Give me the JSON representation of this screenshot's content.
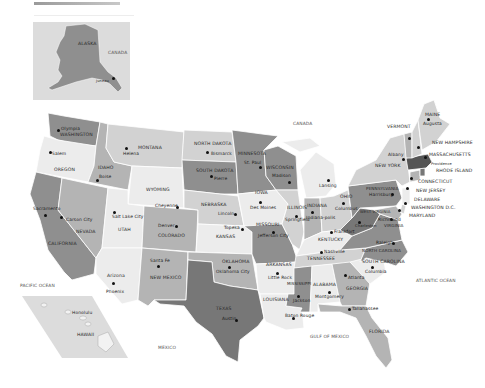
{
  "map": {
    "title_bar": "",
    "colors": {
      "background": "#ffffff",
      "water": "#ffffff",
      "light": "#ececec",
      "mid_light": "#d2d2d2",
      "mid": "#b4b4b4",
      "dark": "#8f8f8f",
      "darker": "#777777",
      "inset_bg": "#dcdcdc",
      "border": "#ffffff"
    },
    "insets": {
      "alaska": {
        "label": "ALASKA",
        "capital": "Juneau",
        "neighbor": "CANADA"
      },
      "hawaii": {
        "label": "HAWAII",
        "capital": "Honolulu"
      }
    },
    "geo_labels": {
      "canada": "CANADA",
      "mexico": "MEXICO",
      "pacific": "PACIFIC OCEAN",
      "atlantic": "ATLANTIC OCEAN",
      "gulf": "GULF OF MEXICO"
    },
    "states": [
      {
        "name": "WASHINGTON",
        "capital": "Olympia"
      },
      {
        "name": "OREGON",
        "capital": "Salem"
      },
      {
        "name": "CALIFORNIA",
        "capital": "Sacramento"
      },
      {
        "name": "NEVADA",
        "capital": "Carson City"
      },
      {
        "name": "IDAHO",
        "capital": "Boise"
      },
      {
        "name": "MONTANA",
        "capital": "Helena"
      },
      {
        "name": "WYOMING",
        "capital": "Cheyenne"
      },
      {
        "name": "UTAH",
        "capital": "Salt Lake City"
      },
      {
        "name": "ARIZONA",
        "capital": "Phoenix"
      },
      {
        "name": "COLORADO",
        "capital": "Denver"
      },
      {
        "name": "NEW MEXICO",
        "capital": "Santa Fe"
      },
      {
        "name": "NORTH DAKOTA",
        "capital": "Bismarck"
      },
      {
        "name": "SOUTH DAKOTA",
        "capital": "Pierre"
      },
      {
        "name": "NEBRASKA",
        "capital": "Lincoln"
      },
      {
        "name": "KANSAS",
        "capital": "Topeka"
      },
      {
        "name": "OKLAHOMA",
        "capital": "Oklahoma City"
      },
      {
        "name": "TEXAS",
        "capital": "Austin"
      },
      {
        "name": "MINNESOTA",
        "capital": "St. Paul"
      },
      {
        "name": "IOWA",
        "capital": "Des Moines"
      },
      {
        "name": "MISSOURI",
        "capital": "Jefferson City"
      },
      {
        "name": "ARKANSAS",
        "capital": "Little Rock"
      },
      {
        "name": "LOUISIANA",
        "capital": "Baton Rouge"
      },
      {
        "name": "WISCONSIN",
        "capital": "Madison"
      },
      {
        "name": "ILLINOIS",
        "capital": "Springfield"
      },
      {
        "name": "MICHIGAN",
        "capital": "Lansing"
      },
      {
        "name": "INDIANA",
        "capital": "Indianapolis"
      },
      {
        "name": "OHIO",
        "capital": "Columbus"
      },
      {
        "name": "KENTUCKY",
        "capital": "Frankfort"
      },
      {
        "name": "TENNESSEE",
        "capital": "Nashville"
      },
      {
        "name": "MISSISSIPPI",
        "capital": "Jackson"
      },
      {
        "name": "ALABAMA",
        "capital": "Montgomery"
      },
      {
        "name": "GEORGIA",
        "capital": "Atlanta"
      },
      {
        "name": "FLORIDA",
        "capital": "Tallahassee"
      },
      {
        "name": "SOUTH CAROLINA",
        "capital": "Columbia"
      },
      {
        "name": "NORTH CAROLINA",
        "capital": "Raleigh"
      },
      {
        "name": "VIRGINIA",
        "capital": "Richmond"
      },
      {
        "name": "WEST VIRGINIA",
        "capital": "Charleston"
      },
      {
        "name": "PENNSYLVANIA",
        "capital": "Harrisburg"
      },
      {
        "name": "NEW YORK",
        "capital": "Albany"
      },
      {
        "name": "VERMONT",
        "capital": "Montpelier"
      },
      {
        "name": "NEW HAMPSHIRE",
        "capital": "Concord"
      },
      {
        "name": "MAINE",
        "capital": "Augusta"
      },
      {
        "name": "MASSACHUSETTS",
        "capital": "Boston"
      },
      {
        "name": "RHODE ISLAND",
        "capital": "Providence"
      },
      {
        "name": "CONNECTICUT",
        "capital": "Hartford"
      },
      {
        "name": "NEW JERSEY",
        "capital": "Trenton"
      },
      {
        "name": "DELAWARE",
        "capital": "Dover"
      },
      {
        "name": "MARYLAND",
        "capital": "Annapolis"
      },
      {
        "name": "WASHINGTON D.C.",
        "capital": ""
      }
    ],
    "labels": {
      "wa": "WASHINGTON",
      "olympia": "Olympia",
      "or": "OREGON",
      "salem": "Salem",
      "ca": "CALIFORNIA",
      "sacramento": "Sacramento",
      "nv": "NEVADA",
      "carson": "Carson City",
      "id": "IDAHO",
      "boise": "Boise",
      "mt": "MONTANA",
      "helena": "Helena",
      "wy": "WYOMING",
      "cheyenne": "Cheyenne",
      "ut": "UTAH",
      "slc": "Salt Lake City",
      "az": "Arizona",
      "phoenix": "Phoenix",
      "co": "COLORADO",
      "denver": "Denver",
      "nm": "NEW MEXICO",
      "santafe": "Santa Fe",
      "nd": "NORTH DAKOTA",
      "bismarck": "Bismarck",
      "sd": "SOUTH DAKOTA",
      "pierre": "Pierre",
      "ne": "NEBRASKA",
      "lincoln": "Lincoln",
      "ks": "KANSAS",
      "topeka": "Topeka",
      "ok": "OKLAHOMA",
      "okc": "Oklahoma City",
      "tx": "TEXAS",
      "austin": "Austin",
      "mn": "MINNESOTA",
      "stpaul": "St. Paul",
      "ia": "IOWA",
      "desmoines": "Des Moines",
      "mo": "MISSOURI",
      "jefferson": "Jefferson City",
      "ar": "ARKANSAS",
      "littlerock": "Little Rock",
      "la": "LOUISIANA",
      "batonrouge": "Baton Rouge",
      "wi": "WISCONSIN",
      "madison": "Madison",
      "il": "ILLINOIS",
      "springfield": "Springfield",
      "mi": "",
      "lansing": "Lansing",
      "in": "INDIANA",
      "indy": "Indiana-polis",
      "oh": "OHIO",
      "columbus": "Columbus",
      "ky": "KENTUCKY",
      "frankfort": "Frankfort",
      "tn": "TENNESSEE",
      "nashville": "Nashville",
      "ms": "MISSISSIPPI",
      "jackson": "Jackson",
      "al": "ALABAMA",
      "montgomery": "Montgomery",
      "ga": "GEORGIA",
      "atlanta": "Atlanta",
      "fl": "FLORIDA",
      "tallahassee": "Tallahassee",
      "sc": "SOUTH CAROLINA",
      "columbia": "Columbia",
      "nc": "NORTH CAROLINA",
      "raleigh": "Raleigh",
      "va": "VIRGINIA",
      "richmond": "Richmond",
      "wv": "WEST VIRGINIA",
      "charleston": "Charleston",
      "pa": "PENNSYLVANIA",
      "harrisburg": "Harrisburg",
      "ny": "NEW YORK",
      "albany": "Albany",
      "vt": "VERMONT",
      "nh": "NEW HAMPSHIRE",
      "me": "MAINE",
      "augusta": "Augusta",
      "ma": "MASSACHUSETTS",
      "ri": "RHODE ISLAND",
      "providence": "Providence",
      "ct": "CONNECTICUT",
      "nj": "NEW JERSEY",
      "de": "DELAWARE",
      "dc": "WASHINGTON D.C.",
      "md": "MARYLAND"
    }
  }
}
